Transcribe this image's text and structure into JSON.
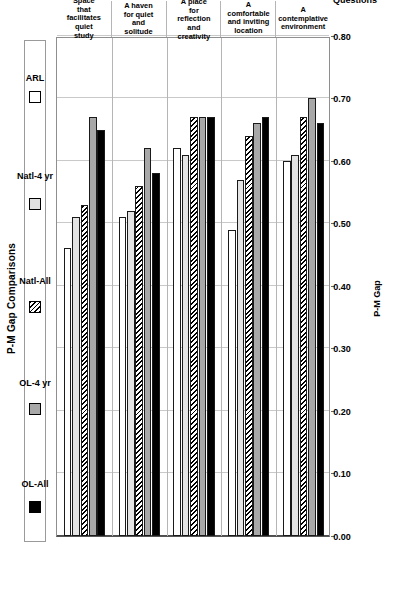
{
  "chart_data": {
    "type": "bar",
    "orientation": "horizontal",
    "title": "P-M Gap Comparisons",
    "xlabel": "Questions",
    "ylabel": "P-M Gap",
    "ylim": [
      0.0,
      0.8
    ],
    "ytick_step": 0.1,
    "grid": true,
    "legend_position": "top",
    "ytick_labels": [
      "0.80",
      "0.70",
      "0.60",
      "0.50",
      "0.40",
      "0.30",
      "0.20",
      "0.10",
      "0.00"
    ],
    "ytick_values": [
      0.8,
      0.7,
      0.6,
      0.5,
      0.4,
      0.3,
      0.2,
      0.1,
      0.0
    ],
    "categories": [
      "Space that facilitates quiet study",
      "A haven for quiet and solitude",
      "A place for reflection and creativity",
      "A comfortable and inviting location",
      "A contemplative environment"
    ],
    "category_numbers": [
      "2",
      "10",
      "13",
      "21",
      "23"
    ],
    "series": [
      {
        "name": "OL-All",
        "fill": "solid-black",
        "color": "#000000",
        "values": [
          0.65,
          0.58,
          0.67,
          0.67,
          0.66
        ]
      },
      {
        "name": "OL-4 yr",
        "fill": "solid-gray",
        "color": "#a8a8a8",
        "values": [
          0.67,
          0.62,
          0.67,
          0.66,
          0.7
        ]
      },
      {
        "name": "Natl-All",
        "fill": "hatched",
        "color": "#ffffff",
        "values": [
          0.53,
          0.56,
          0.67,
          0.64,
          0.67
        ]
      },
      {
        "name": "Natl-4 yr",
        "fill": "solid-lgray",
        "color": "#e4e4e4",
        "values": [
          0.51,
          0.52,
          0.61,
          0.57,
          0.61
        ]
      },
      {
        "name": "ARL",
        "fill": "solid-white",
        "color": "#ffffff",
        "values": [
          0.46,
          0.51,
          0.62,
          0.49,
          0.6
        ]
      }
    ]
  }
}
